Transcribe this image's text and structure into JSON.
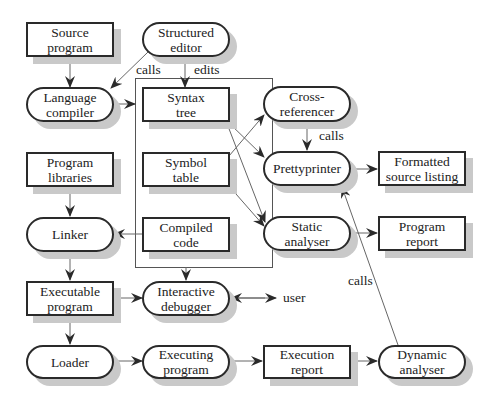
{
  "nodes": {
    "source_program": {
      "label": "Source\nprogram",
      "shape": "rect"
    },
    "structured_editor": {
      "label": "Structured\neditor",
      "shape": "pill"
    },
    "language_compiler": {
      "label": "Language\ncompiler",
      "shape": "pill"
    },
    "syntax_tree": {
      "label": "Syntax\ntree",
      "shape": "rect"
    },
    "cross_referencer": {
      "label": "Cross-\nreferencer",
      "shape": "pill"
    },
    "prettyprinter": {
      "label": "Prettyprinter",
      "shape": "pill"
    },
    "formatted_source_listing": {
      "label": "Formatted\nsource listing",
      "shape": "rect"
    },
    "program_libraries": {
      "label": "Program\nlibraries",
      "shape": "rect"
    },
    "symbol_table": {
      "label": "Symbol\ntable",
      "shape": "rect"
    },
    "linker": {
      "label": "Linker",
      "shape": "pill"
    },
    "compiled_code": {
      "label": "Compiled\ncode",
      "shape": "rect"
    },
    "static_analyser": {
      "label": "Static\nanalyser",
      "shape": "pill"
    },
    "program_report": {
      "label": "Program\nreport",
      "shape": "rect"
    },
    "executable_program": {
      "label": "Executable\nprogram",
      "shape": "rect"
    },
    "interactive_debugger": {
      "label": "Interactive\ndebugger",
      "shape": "pill"
    },
    "loader": {
      "label": "Loader",
      "shape": "pill"
    },
    "executing_program": {
      "label": "Executing\nprogram",
      "shape": "pill"
    },
    "execution_report": {
      "label": "Execution\nreport",
      "shape": "rect"
    },
    "dynamic_analyser": {
      "label": "Dynamic\nanalyser",
      "shape": "pill"
    }
  },
  "edge_labels": {
    "calls_editor_compiler": "calls",
    "edits": "edits",
    "calls_xref_pretty": "calls",
    "calls_dynamic_pretty": "calls",
    "user": "user"
  },
  "edges": [
    {
      "from": "Source program",
      "to": "Language compiler"
    },
    {
      "from": "Structured editor",
      "to": "Language compiler",
      "label": "calls"
    },
    {
      "from": "Structured editor",
      "to": "Syntax tree",
      "label": "edits"
    },
    {
      "from": "Language compiler",
      "to": "Syntax tree"
    },
    {
      "from": "Syntax tree",
      "to": "Prettyprinter"
    },
    {
      "from": "Syntax tree",
      "to": "Static analyser"
    },
    {
      "from": "Symbol table",
      "to": "Cross-referencer"
    },
    {
      "from": "Symbol table",
      "to": "Static analyser"
    },
    {
      "from": "Cross-referencer",
      "to": "Prettyprinter",
      "label": "calls"
    },
    {
      "from": "Prettyprinter",
      "to": "Formatted source listing"
    },
    {
      "from": "Static analyser",
      "to": "Program report"
    },
    {
      "from": "Program libraries",
      "to": "Linker"
    },
    {
      "from": "Compiled code",
      "to": "Linker"
    },
    {
      "from": "Linker",
      "to": "Executable program"
    },
    {
      "from": "Executable program",
      "to": "Interactive debugger"
    },
    {
      "from": "Compilation box",
      "to": "Interactive debugger"
    },
    {
      "from": "Interactive debugger",
      "to": "user",
      "bidirectional": true
    },
    {
      "from": "Executable program",
      "to": "Loader"
    },
    {
      "from": "Loader",
      "to": "Executing program"
    },
    {
      "from": "Executing program",
      "to": "Execution report"
    },
    {
      "from": "Execution report",
      "to": "Dynamic analyser"
    },
    {
      "from": "Dynamic analyser",
      "to": "Prettyprinter",
      "label": "calls"
    }
  ],
  "colors": {
    "stroke": "#2a2a2a",
    "shadow": "#c9c9c9",
    "thin_line": "#555555"
  }
}
